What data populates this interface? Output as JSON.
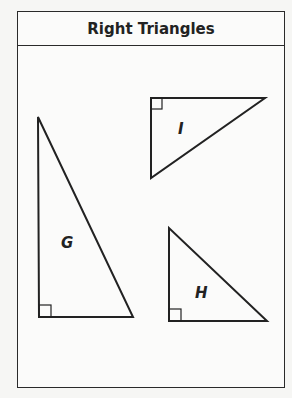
{
  "title": "Right Triangles",
  "triangles": [
    {
      "label": "I",
      "points": "151,98 265,98 151,178",
      "right_angle_corner": [
        151,
        98
      ],
      "label_pos": [
        183,
        130
      ]
    },
    {
      "label": "G",
      "points": "38,117 39,317 133,317",
      "right_angle_corner": [
        39,
        317
      ],
      "label_pos": [
        67,
        247
      ]
    },
    {
      "label": "H",
      "points": "169,228 169,321 267,321",
      "right_angle_corner": [
        169,
        321
      ],
      "label_pos": [
        201,
        294
      ]
    }
  ],
  "colors": {
    "stroke": "#222222",
    "background": "#f6f6f4"
  }
}
